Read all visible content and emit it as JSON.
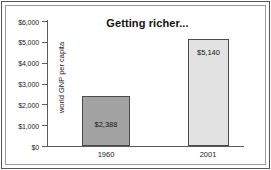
{
  "chart_data": {
    "type": "bar",
    "title": "Getting richer...",
    "xlabel": "",
    "ylabel": "world GNP per capita",
    "categories": [
      "1960",
      "2001"
    ],
    "values": [
      2388,
      5140
    ],
    "value_labels": [
      "$2,388",
      "$5,140"
    ],
    "ylim": [
      0,
      6000
    ],
    "ytick_values": [
      0,
      1000,
      2000,
      3000,
      4000,
      5000,
      6000
    ],
    "ytick_labels": [
      "$0",
      "$1,000",
      "$2,000",
      "$3,000",
      "$4,000",
      "$5,000",
      "$6,000"
    ],
    "grid": false,
    "legend": false,
    "series": [
      {
        "name": "world GNP per capita",
        "values": [
          2388,
          5140
        ],
        "colors": [
          "#a3a3a3",
          "#e2e2e2"
        ]
      }
    ],
    "bar_colors": {
      "bar_1960": "#a3a3a3",
      "bar_2001": "#e2e2e2",
      "bar_outline": "#4a4a4a",
      "axis": "#5a5a5a",
      "text": "#1a1a1a"
    }
  }
}
